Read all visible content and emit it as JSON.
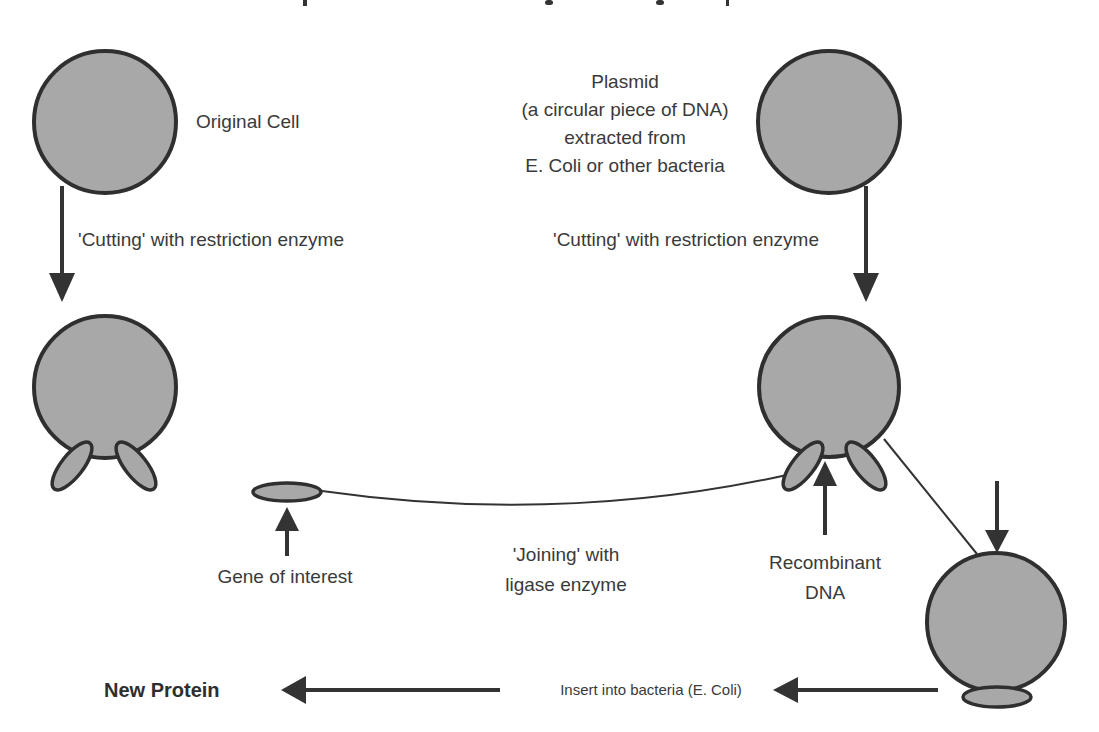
{
  "diagram": {
    "colors": {
      "cell_fill": "#a8a8a8",
      "outline": "#2f2f2f",
      "text": "#3a3a3a"
    },
    "labels": {
      "original_cell": "Original Cell",
      "plasmid_lines": [
        "Plasmid",
        "(a circular piece of DNA)",
        "extracted from",
        "E. Coli or other bacteria"
      ],
      "cutting_left": "'Cutting' with restriction enzyme",
      "cutting_right": "'Cutting' with restriction enzyme",
      "gene_of_interest": "Gene of interest",
      "joining_lines": [
        "'Joining' with",
        "ligase enzyme"
      ],
      "recombinant_lines": [
        "Recombinant",
        "DNA"
      ],
      "insert": "Insert into bacteria (E. Coli)",
      "new_protein": "New Protein"
    },
    "nodes": [
      {
        "id": "original-cell",
        "type": "cell"
      },
      {
        "id": "plasmid",
        "type": "cell"
      },
      {
        "id": "cut-cell",
        "type": "cell-with-fragments"
      },
      {
        "id": "cut-plasmid",
        "type": "cell-with-fragments"
      },
      {
        "id": "gene-fragment",
        "type": "fragment"
      },
      {
        "id": "bacterium",
        "type": "cell-with-fragment"
      }
    ],
    "edges": [
      {
        "from": "original-cell",
        "to": "cut-cell",
        "label_key": "cutting_left"
      },
      {
        "from": "plasmid",
        "to": "cut-plasmid",
        "label_key": "cutting_right"
      },
      {
        "from": "gene-fragment",
        "to": "cut-plasmid",
        "label_key": "joining_lines"
      },
      {
        "from": "cut-plasmid",
        "to": "bacterium",
        "label_key": "recombinant_lines"
      },
      {
        "from": "bacterium",
        "to": "new-protein",
        "label_key": "insert"
      }
    ]
  }
}
